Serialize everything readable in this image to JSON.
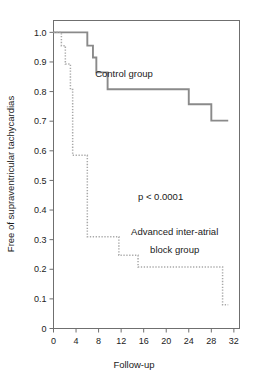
{
  "chart_data": {
    "type": "line",
    "title": "",
    "xlabel": "Follow-up",
    "ylabel": "Free of supraventricular tachycardias",
    "xlim": [
      0,
      33
    ],
    "ylim": [
      0,
      1.04
    ],
    "xticks": [
      0,
      4,
      8,
      12,
      16,
      20,
      24,
      28,
      32
    ],
    "xtick_labels": [
      "0",
      "4",
      "8",
      "12",
      "16",
      "20",
      "24",
      "28",
      "32"
    ],
    "yticks": [
      0,
      0.1,
      0.2,
      0.3,
      0.4,
      0.5,
      0.6,
      0.7,
      0.8,
      0.9,
      1.0
    ],
    "ytick_labels": [
      "0",
      "0.1",
      "0.2",
      "0.3",
      "0.4",
      "0.5",
      "0.6",
      "0.7",
      "0.8",
      "0.9",
      "1.0"
    ],
    "grid": false,
    "legend": "inline-annotations",
    "annotations": [
      {
        "name": "control-group-label",
        "text": "Control group",
        "x": 12.5,
        "y": 0.85
      },
      {
        "name": "p-value-label",
        "text": "p < 0.0001",
        "x": 19.0,
        "y": 0.435
      },
      {
        "name": "advanced-group-label-line1",
        "text": "Advanced inter-atrial",
        "x": 21.5,
        "y": 0.315
      },
      {
        "name": "advanced-group-label-line2",
        "text": "block group",
        "x": 21.5,
        "y": 0.255
      }
    ],
    "series": [
      {
        "name": "Control group",
        "style": "solid",
        "color": "#8a8a8a",
        "steps": [
          [
            0,
            1.0
          ],
          [
            6.0,
            1.0
          ],
          [
            6.0,
            0.955
          ],
          [
            7.0,
            0.955
          ],
          [
            7.0,
            0.915
          ],
          [
            7.6,
            0.915
          ],
          [
            7.6,
            0.865
          ],
          [
            9.6,
            0.865
          ],
          [
            9.6,
            0.808
          ],
          [
            24.0,
            0.808
          ],
          [
            24.0,
            0.757
          ],
          [
            28.0,
            0.757
          ],
          [
            28.0,
            0.702
          ],
          [
            31.0,
            0.702
          ]
        ]
      },
      {
        "name": "Advanced inter-atrial block group",
        "style": "dotted",
        "color": "#a8a8a8",
        "steps": [
          [
            0,
            1.0
          ],
          [
            1.4,
            1.0
          ],
          [
            1.4,
            0.955
          ],
          [
            2.1,
            0.955
          ],
          [
            2.1,
            0.893
          ],
          [
            3.0,
            0.893
          ],
          [
            3.0,
            0.807
          ],
          [
            3.4,
            0.807
          ],
          [
            3.4,
            0.585
          ],
          [
            6.0,
            0.585
          ],
          [
            6.0,
            0.31
          ],
          [
            11.6,
            0.31
          ],
          [
            11.6,
            0.247
          ],
          [
            15.0,
            0.247
          ],
          [
            15.0,
            0.208
          ],
          [
            30.0,
            0.208
          ],
          [
            30.0,
            0.08
          ],
          [
            31.0,
            0.08
          ]
        ]
      }
    ]
  },
  "figure": {
    "axis": {
      "x_title": "Follow-up",
      "y_title": "Free of supraventricular tachycardias"
    }
  }
}
